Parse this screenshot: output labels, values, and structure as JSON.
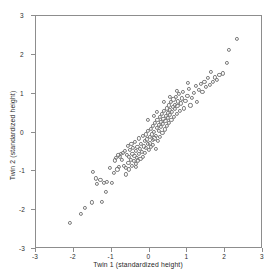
{
  "chart_data": {
    "type": "scatter",
    "title": "",
    "xlabel": "Twin 1 (standardized height)",
    "ylabel": "Twin 2 (standardized height)",
    "xlim": [
      -3,
      3
    ],
    "ylim": [
      -3,
      3
    ],
    "xticks": [
      -3,
      -2,
      -1,
      0,
      1,
      2,
      3
    ],
    "yticks": [
      -3,
      -2,
      -1,
      0,
      1,
      2,
      3
    ],
    "xtick_labels": [
      "-3",
      "-2",
      "-1",
      "0",
      "1",
      "2",
      "3"
    ],
    "ytick_labels": [
      "-3",
      "-2",
      "-1",
      "0",
      "1",
      "2",
      "3"
    ],
    "grid": false,
    "legend": null,
    "marker": "open-circle",
    "marker_color": "#7a7a7a",
    "points": [
      [
        -2.1,
        -2.32
      ],
      [
        -1.82,
        -2.1
      ],
      [
        -1.7,
        -1.95
      ],
      [
        -1.52,
        -1.8
      ],
      [
        -1.5,
        -1.02
      ],
      [
        -1.42,
        -1.18
      ],
      [
        -1.38,
        -1.32
      ],
      [
        -1.3,
        -1.22
      ],
      [
        -1.25,
        -1.78
      ],
      [
        -1.2,
        -1.3
      ],
      [
        -1.12,
        -1.28
      ],
      [
        -1.05,
        -0.92
      ],
      [
        -1.0,
        -1.3
      ],
      [
        -0.95,
        -1.05
      ],
      [
        -0.92,
        -0.72
      ],
      [
        -0.88,
        -0.66
      ],
      [
        -0.85,
        -0.95
      ],
      [
        -0.82,
        -0.58
      ],
      [
        -0.8,
        -0.88
      ],
      [
        -0.78,
        -0.62
      ],
      [
        -0.75,
        -0.55
      ],
      [
        -0.72,
        -0.7
      ],
      [
        -0.7,
        -0.52
      ],
      [
        -0.68,
        -0.85
      ],
      [
        -0.65,
        -0.48
      ],
      [
        -0.63,
        -0.92
      ],
      [
        -0.6,
        -0.58
      ],
      [
        -0.58,
        -0.35
      ],
      [
        -0.56,
        -0.78
      ],
      [
        -0.54,
        -0.62
      ],
      [
        -0.52,
        -0.44
      ],
      [
        -0.5,
        -0.7
      ],
      [
        -0.48,
        -0.3
      ],
      [
        -0.46,
        -0.86
      ],
      [
        -0.45,
        -0.55
      ],
      [
        -0.43,
        -0.4
      ],
      [
        -0.42,
        -0.74
      ],
      [
        -0.4,
        -0.6
      ],
      [
        -0.38,
        -0.25
      ],
      [
        -0.36,
        -0.8
      ],
      [
        -0.35,
        -0.48
      ],
      [
        -0.33,
        -0.66
      ],
      [
        -0.32,
        -0.38
      ],
      [
        -0.3,
        -0.72
      ],
      [
        -0.28,
        -0.15
      ],
      [
        -0.27,
        -0.55
      ],
      [
        -0.25,
        -0.42
      ],
      [
        -0.24,
        -0.68
      ],
      [
        -0.22,
        -0.3
      ],
      [
        -0.2,
        -0.5
      ],
      [
        -0.18,
        -0.08
      ],
      [
        -0.17,
        -0.62
      ],
      [
        -0.15,
        -0.36
      ],
      [
        -0.13,
        -0.22
      ],
      [
        -0.12,
        -0.52
      ],
      [
        -0.1,
        -0.05
      ],
      [
        -0.09,
        -0.4
      ],
      [
        -0.07,
        -0.18
      ],
      [
        -0.05,
        -0.3
      ],
      [
        -0.04,
        0.05
      ],
      [
        -0.02,
        -0.45
      ],
      [
        0.0,
        -0.12
      ],
      [
        0.01,
        -0.28
      ],
      [
        0.03,
        0.1
      ],
      [
        0.04,
        -0.38
      ],
      [
        0.06,
        -0.05
      ],
      [
        0.08,
        -0.2
      ],
      [
        0.09,
        0.18
      ],
      [
        0.1,
        -0.32
      ],
      [
        0.12,
        0.02
      ],
      [
        0.13,
        -0.15
      ],
      [
        0.15,
        0.25
      ],
      [
        0.16,
        -0.42
      ],
      [
        0.18,
        -0.08
      ],
      [
        0.19,
        0.12
      ],
      [
        0.21,
        0.32
      ],
      [
        0.22,
        -0.22
      ],
      [
        0.24,
        0.05
      ],
      [
        0.25,
        0.2
      ],
      [
        0.27,
        0.4
      ],
      [
        0.28,
        -0.12
      ],
      [
        0.3,
        0.15
      ],
      [
        0.31,
        0.28
      ],
      [
        0.33,
        0.48
      ],
      [
        0.34,
        -0.02
      ],
      [
        0.36,
        0.22
      ],
      [
        0.37,
        0.35
      ],
      [
        0.39,
        0.55
      ],
      [
        0.4,
        0.08
      ],
      [
        0.42,
        0.3
      ],
      [
        0.43,
        0.42
      ],
      [
        0.45,
        0.62
      ],
      [
        0.46,
        0.18
      ],
      [
        0.48,
        0.38
      ],
      [
        0.49,
        0.5
      ],
      [
        0.51,
        0.7
      ],
      [
        0.52,
        0.25
      ],
      [
        0.54,
        0.45
      ],
      [
        0.55,
        0.58
      ],
      [
        0.57,
        0.78
      ],
      [
        0.58,
        0.32
      ],
      [
        0.6,
        0.52
      ],
      [
        0.62,
        0.65
      ],
      [
        0.63,
        0.85
      ],
      [
        0.65,
        0.4
      ],
      [
        0.67,
        0.6
      ],
      [
        0.68,
        0.72
      ],
      [
        0.7,
        0.92
      ],
      [
        0.72,
        0.48
      ],
      [
        0.74,
        0.68
      ],
      [
        0.76,
        0.8
      ],
      [
        0.78,
        1.0
      ],
      [
        0.8,
        0.55
      ],
      [
        0.82,
        0.75
      ],
      [
        0.85,
        0.88
      ],
      [
        0.88,
        1.05
      ],
      [
        0.9,
        0.62
      ],
      [
        0.95,
        0.82
      ],
      [
        1.0,
        0.95
      ],
      [
        1.05,
        1.12
      ],
      [
        1.08,
        0.7
      ],
      [
        1.12,
        0.9
      ],
      [
        1.18,
        1.02
      ],
      [
        1.22,
        1.2
      ],
      [
        1.25,
        0.78
      ],
      [
        1.3,
        1.1
      ],
      [
        1.35,
        1.25
      ],
      [
        1.4,
        1.05
      ],
      [
        1.45,
        1.3
      ],
      [
        1.5,
        1.18
      ],
      [
        1.55,
        1.4
      ],
      [
        1.6,
        1.22
      ],
      [
        1.62,
        1.55
      ],
      [
        1.68,
        1.3
      ],
      [
        1.72,
        1.42
      ],
      [
        1.78,
        1.35
      ],
      [
        1.85,
        1.48
      ],
      [
        1.95,
        1.52
      ],
      [
        2.05,
        1.8
      ],
      [
        2.1,
        2.12
      ],
      [
        2.3,
        2.42
      ],
      [
        -0.55,
        -0.95
      ],
      [
        -0.35,
        -0.88
      ],
      [
        0.55,
        0.92
      ],
      [
        0.38,
        0.78
      ],
      [
        0.2,
        0.52
      ],
      [
        -0.05,
        0.32
      ],
      [
        0.72,
        1.08
      ],
      [
        1.02,
        1.28
      ],
      [
        -1.15,
        -1.52
      ],
      [
        -0.62,
        -1.08
      ],
      [
        0.12,
        0.42
      ]
    ]
  }
}
